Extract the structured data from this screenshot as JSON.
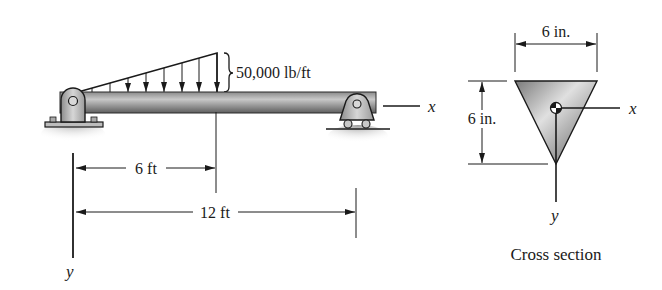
{
  "beam": {
    "load_label": "50,000 lb/ft",
    "axis_x_label": "x",
    "axis_y_label": "y",
    "dim_short_label": "6 ft",
    "dim_long_label": "12 ft",
    "left_support": "pin-support",
    "right_support": "roller-support",
    "load_type": "linearly increasing distributed load"
  },
  "cross_section": {
    "width_label": "6 in.",
    "height_label": "6 in.",
    "axis_x_label": "x",
    "axis_y_label": "y",
    "caption": "Cross section",
    "shape": "inverted isosceles triangle"
  },
  "colors": {
    "line": "#1a1a1a",
    "beam_fill_light": "#c9c9c9",
    "beam_fill_dark": "#6e6e6e",
    "support_fill": "#bdbdbd",
    "shadow": "#9a9a9a"
  }
}
